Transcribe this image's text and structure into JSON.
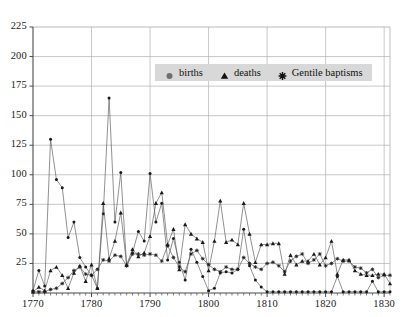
{
  "chart_data": {
    "type": "line",
    "title": "",
    "subtitle": "",
    "xlabel": "",
    "ylabel": "",
    "xlim": [
      1770,
      1831
    ],
    "ylim": [
      0,
      225
    ],
    "xticks": [
      1770,
      1780,
      1790,
      1800,
      1810,
      1820,
      1830
    ],
    "yticks": [
      0,
      25,
      50,
      75,
      100,
      125,
      150,
      175,
      200,
      225
    ],
    "grid": true,
    "legend_position": "top-center",
    "x": [
      1770,
      1771,
      1772,
      1773,
      1774,
      1775,
      1776,
      1777,
      1778,
      1779,
      1780,
      1781,
      1782,
      1783,
      1784,
      1785,
      1786,
      1787,
      1788,
      1789,
      1790,
      1791,
      1792,
      1793,
      1794,
      1795,
      1796,
      1797,
      1798,
      1799,
      1800,
      1801,
      1802,
      1803,
      1804,
      1805,
      1806,
      1807,
      1808,
      1809,
      1810,
      1811,
      1812,
      1813,
      1814,
      1815,
      1816,
      1817,
      1818,
      1819,
      1820,
      1821,
      1822,
      1823,
      1824,
      1825,
      1826,
      1827,
      1828,
      1829,
      1830,
      1831
    ],
    "series": [
      {
        "name": "births",
        "marker": "circle",
        "values": [
          2,
          19,
          6,
          130,
          96,
          89,
          47,
          60,
          30,
          22,
          15,
          4,
          67,
          165,
          60,
          102,
          23,
          34,
          52,
          44,
          101,
          60,
          76,
          28,
          46,
          26,
          11,
          37,
          26,
          14,
          2,
          4,
          17,
          18,
          17,
          20,
          54,
          23,
          11,
          5,
          1,
          1,
          1,
          1,
          1,
          1,
          1,
          1,
          1,
          1,
          1,
          1,
          14,
          1,
          1,
          1,
          1,
          1,
          10,
          1,
          1,
          1
        ]
      },
      {
        "name": "deaths",
        "marker": "triangle",
        "values": [
          1,
          5,
          2,
          19,
          22,
          15,
          4,
          17,
          23,
          10,
          24,
          4,
          76,
          29,
          44,
          68,
          24,
          37,
          31,
          34,
          48,
          76,
          85,
          41,
          54,
          20,
          58,
          50,
          46,
          43,
          19,
          44,
          78,
          43,
          45,
          41,
          76,
          50,
          26,
          41,
          41,
          42,
          42,
          16,
          32,
          24,
          27,
          27,
          33,
          24,
          30,
          44,
          16,
          28,
          28,
          19,
          16,
          15,
          15,
          16,
          16,
          8
        ]
      },
      {
        "name": "Gentile baptisms",
        "marker": "asterisk",
        "values": [
          1,
          1,
          1,
          3,
          4,
          8,
          13,
          19,
          22,
          16,
          15,
          20,
          28,
          27,
          32,
          31,
          23,
          33,
          33,
          32,
          33,
          32,
          27,
          40,
          30,
          22,
          18,
          33,
          36,
          29,
          24,
          20,
          18,
          22,
          20,
          20,
          30,
          25,
          22,
          20,
          25,
          26,
          23,
          18,
          27,
          31,
          33,
          25,
          28,
          33,
          23,
          25,
          29,
          27,
          27,
          22,
          21,
          17,
          20,
          13,
          15,
          15
        ]
      }
    ],
    "legend": [
      {
        "label": "births",
        "marker": "circle-marker-icon"
      },
      {
        "label": "deaths",
        "marker": "triangle-marker-icon"
      },
      {
        "label": "Gentile baptisms",
        "marker": "asterisk-marker-icon"
      }
    ],
    "colors": {
      "series_line": "#555555",
      "marker": "#1a1a1a",
      "grid": "#b0b0b0",
      "axis": "#4a4a4a",
      "plot_background": "#ffffff",
      "legend_background": "#d8d8d8",
      "text": "#1a1a1a"
    }
  }
}
